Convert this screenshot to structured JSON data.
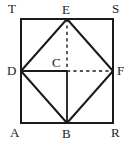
{
  "figure": {
    "width": 133,
    "height": 145,
    "background_color": "#ffffff",
    "stroke_color": "#1a1a1a",
    "label_color": "#1a1a1a"
  },
  "points": {
    "T": {
      "label": "T",
      "x": 21,
      "y": 19,
      "label_x": 8,
      "label_y": 2
    },
    "S": {
      "label": "S",
      "x": 113,
      "y": 19,
      "label_x": 112,
      "label_y": 2
    },
    "A": {
      "label": "A",
      "x": 21,
      "y": 123,
      "label_x": 10,
      "label_y": 126
    },
    "R": {
      "label": "R",
      "x": 113,
      "y": 123,
      "label_x": 111,
      "label_y": 126
    },
    "E": {
      "label": "E",
      "x": 67,
      "y": 19,
      "label_x": 62,
      "label_y": 3
    },
    "D": {
      "label": "D",
      "x": 21,
      "y": 71,
      "label_x": 7,
      "label_y": 64
    },
    "F": {
      "label": "F",
      "x": 113,
      "y": 71,
      "label_x": 117,
      "label_y": 64
    },
    "B": {
      "label": "B",
      "x": 67,
      "y": 123,
      "label_x": 62,
      "label_y": 127
    },
    "C": {
      "label": "C",
      "x": 67,
      "y": 71,
      "label_x": 52,
      "label_y": 56
    }
  },
  "segments": [
    {
      "name": "square-side-top",
      "from": "T",
      "to": "S",
      "style": "solid",
      "width": 2
    },
    {
      "name": "square-side-right",
      "from": "S",
      "to": "R",
      "style": "solid",
      "width": 2
    },
    {
      "name": "square-side-bottom",
      "from": "R",
      "to": "A",
      "style": "solid",
      "width": 2
    },
    {
      "name": "square-side-left",
      "from": "A",
      "to": "T",
      "style": "solid",
      "width": 2
    },
    {
      "name": "rhombus-side-ED",
      "from": "E",
      "to": "D",
      "style": "solid",
      "width": 2
    },
    {
      "name": "rhombus-side-EF",
      "from": "E",
      "to": "F",
      "style": "solid",
      "width": 2
    },
    {
      "name": "rhombus-side-DB",
      "from": "D",
      "to": "B",
      "style": "solid",
      "width": 2
    },
    {
      "name": "rhombus-side-BF",
      "from": "B",
      "to": "F",
      "style": "solid",
      "width": 2
    },
    {
      "name": "diagonal-EC",
      "from": "E",
      "to": "C",
      "style": "dashed",
      "width": 1.4
    },
    {
      "name": "diagonal-CB",
      "from": "C",
      "to": "B",
      "style": "solid",
      "width": 1.8
    },
    {
      "name": "diagonal-DC",
      "from": "D",
      "to": "C",
      "style": "solid",
      "width": 1.8
    },
    {
      "name": "diagonal-CF",
      "from": "C",
      "to": "F",
      "style": "dashed",
      "width": 1.4
    }
  ],
  "labels_order": [
    "T",
    "E",
    "S",
    "D",
    "C",
    "F",
    "A",
    "B",
    "R"
  ]
}
